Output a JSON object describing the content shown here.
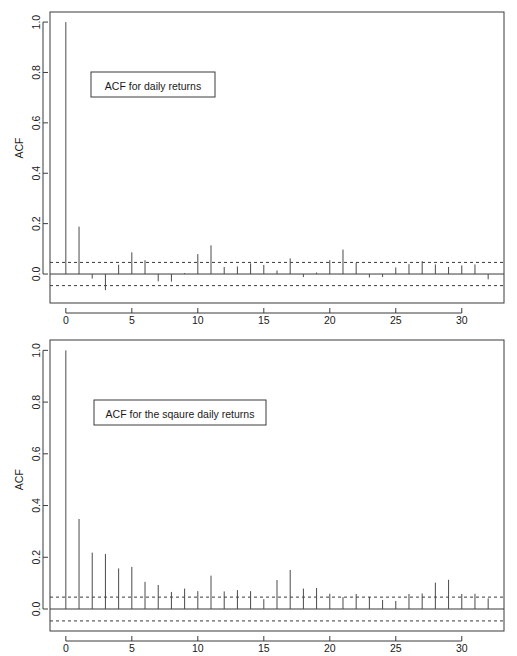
{
  "page": {
    "background_color": "#ffffff",
    "ink_color": "#3a3a3a"
  },
  "chart_data": [
    {
      "id": "acf-daily-returns",
      "type": "bar",
      "title": "ACF for daily returns",
      "xlabel": "",
      "ylabel": "ACF",
      "xlim": [
        -1.2,
        33.2
      ],
      "ylim": [
        -0.115,
        1.04
      ],
      "xticks": [
        0,
        5,
        10,
        15,
        20,
        25,
        30
      ],
      "yticks": [
        0.0,
        0.2,
        0.4,
        0.6,
        0.8,
        1.0
      ],
      "ytick_labels": [
        "0.0",
        "0.2",
        "0.4",
        "0.6",
        "0.8",
        "1.0"
      ],
      "xtick_labels": [
        "0",
        "5",
        "10",
        "15",
        "20",
        "25",
        "30"
      ],
      "grid": false,
      "legend": "none",
      "confidence_bounds": [
        0.046,
        -0.046
      ],
      "confidence_style": "dashed",
      "zero_line": 0.0,
      "categories": [
        0,
        1,
        2,
        3,
        4,
        5,
        6,
        7,
        8,
        9,
        10,
        11,
        12,
        13,
        14,
        15,
        16,
        17,
        18,
        19,
        20,
        21,
        22,
        23,
        24,
        25,
        26,
        27,
        28,
        29,
        30,
        31,
        32
      ],
      "values": [
        1.0,
        0.188,
        -0.018,
        -0.064,
        0.037,
        0.086,
        0.055,
        -0.029,
        -0.03,
        0.004,
        0.079,
        0.114,
        0.028,
        0.03,
        0.042,
        0.036,
        0.014,
        0.062,
        -0.012,
        0.006,
        0.055,
        0.097,
        0.044,
        -0.014,
        -0.012,
        0.026,
        0.039,
        0.051,
        0.038,
        0.028,
        0.034,
        0.038,
        -0.021
      ]
    },
    {
      "id": "acf-square-daily-returns",
      "type": "bar",
      "title": "ACF for the sqaure daily returns",
      "xlabel": "",
      "ylabel": "ACF",
      "xlim": [
        -1.2,
        33.2
      ],
      "ylim": [
        -0.085,
        1.04
      ],
      "xticks": [
        0,
        5,
        10,
        15,
        20,
        25,
        30
      ],
      "yticks": [
        0.0,
        0.2,
        0.4,
        0.6,
        0.8,
        1.0
      ],
      "ytick_labels": [
        "0.0",
        "0.2",
        "0.4",
        "0.6",
        "0.8",
        "1.0"
      ],
      "xtick_labels": [
        "0",
        "5",
        "10",
        "15",
        "20",
        "25",
        "30"
      ],
      "grid": false,
      "legend": "none",
      "confidence_bounds": [
        0.046,
        -0.046
      ],
      "confidence_style": "dashed",
      "zero_line": 0.0,
      "categories": [
        0,
        1,
        2,
        3,
        4,
        5,
        6,
        7,
        8,
        9,
        10,
        11,
        12,
        13,
        14,
        15,
        16,
        17,
        18,
        19,
        20,
        21,
        22,
        23,
        24,
        25,
        26,
        27,
        28,
        29,
        30,
        31,
        32
      ],
      "values": [
        1.0,
        0.348,
        0.218,
        0.213,
        0.157,
        0.163,
        0.105,
        0.093,
        0.066,
        0.079,
        0.069,
        0.129,
        0.068,
        0.073,
        0.069,
        0.038,
        0.112,
        0.151,
        0.079,
        0.081,
        0.059,
        0.046,
        0.058,
        0.047,
        0.035,
        0.031,
        0.058,
        0.06,
        0.102,
        0.113,
        0.058,
        0.059,
        0.041
      ]
    }
  ]
}
